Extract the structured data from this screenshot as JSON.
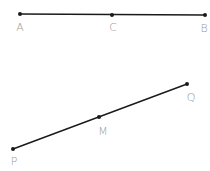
{
  "diagram": {
    "segments": [
      {
        "name": "AB",
        "points": [
          {
            "label": "A",
            "x": 20,
            "y": 14,
            "lx": 20,
            "ly": 31
          },
          {
            "label": "C",
            "x": 112,
            "y": 15,
            "lx": 113,
            "ly": 31
          },
          {
            "label": "B",
            "x": 205,
            "y": 15,
            "lx": 204,
            "ly": 32
          }
        ]
      },
      {
        "name": "PQ",
        "points": [
          {
            "label": "P",
            "x": 13,
            "y": 149,
            "lx": 14,
            "ly": 165
          },
          {
            "label": "M",
            "x": 99,
            "y": 117,
            "lx": 103,
            "ly": 135
          },
          {
            "label": "Q",
            "x": 187,
            "y": 84,
            "lx": 191,
            "ly": 101
          }
        ]
      }
    ],
    "colors": {
      "line": "#1a1a1a",
      "label": "#9a9a9a"
    }
  }
}
